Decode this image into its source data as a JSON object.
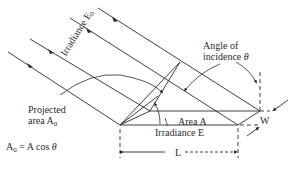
{
  "figure": {
    "type": "diagram",
    "labels": {
      "irradiance_e0": "Irradiance E",
      "irradiance_e0_sub": "0",
      "angle_line1": "Angle of",
      "angle_line2": "incidence",
      "angle_symbol": "θ",
      "projected_line1": "Projected",
      "projected_line2": "area A",
      "projected_sub": "0",
      "area_a": "Area A",
      "irradiance_e": "Irradiance E",
      "width_w": "W",
      "length_l": "L",
      "formula_lhs": "A",
      "formula_sub": "0",
      "formula_rhs": " = A cos ",
      "formula_theta": "θ"
    },
    "colors": {
      "line": "#2a2a2a",
      "background": "#ffffff"
    }
  }
}
